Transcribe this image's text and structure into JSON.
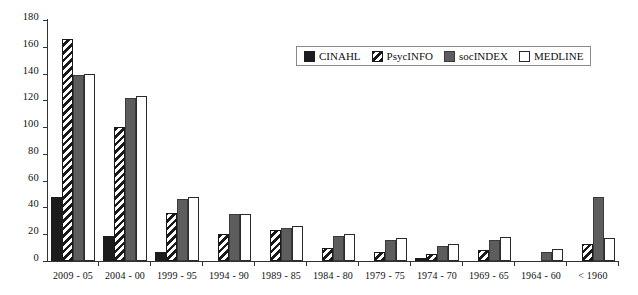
{
  "chart_data": {
    "type": "bar",
    "title": "",
    "subtitle": "",
    "xlabel": "",
    "ylabel": "",
    "ylim": [
      0,
      180
    ],
    "yticks": [
      0,
      20,
      40,
      60,
      80,
      100,
      120,
      140,
      160,
      180
    ],
    "grid": false,
    "legend_position": "top-center",
    "categories": [
      "2009 - 05",
      "2004 - 00",
      "1999 - 95",
      "1994 - 90",
      "1989 - 85",
      "1984 - 80",
      "1979 - 75",
      "1974 - 70",
      "1969 - 65",
      "1964 - 60",
      "< 1960"
    ],
    "series": [
      {
        "name": "CINAHL",
        "color": "#1c1c1c",
        "fill": "solid-black",
        "values": [
          48,
          19,
          7,
          0,
          0,
          0,
          0,
          2,
          0,
          0,
          0
        ]
      },
      {
        "name": "PsycINFO",
        "color": "#191919",
        "fill": "diagonal-stripes",
        "values": [
          166,
          100,
          36,
          20,
          23,
          10,
          7,
          5,
          8,
          0,
          13
        ]
      },
      {
        "name": "socINDEX",
        "color": "#5d5d5d",
        "fill": "solid-gray",
        "values": [
          139,
          122,
          46,
          35,
          25,
          19,
          16,
          11,
          16,
          7,
          48
        ]
      },
      {
        "name": "MEDLINE",
        "color": "#ffffff",
        "fill": "solid-white",
        "values": [
          140,
          123,
          48,
          35,
          26,
          20,
          17,
          13,
          18,
          9,
          17
        ]
      }
    ]
  },
  "legend": {
    "items": [
      {
        "label": "CINAHL"
      },
      {
        "label": "PsycINFO"
      },
      {
        "label": "socINDEX"
      },
      {
        "label": "MEDLINE"
      }
    ]
  }
}
